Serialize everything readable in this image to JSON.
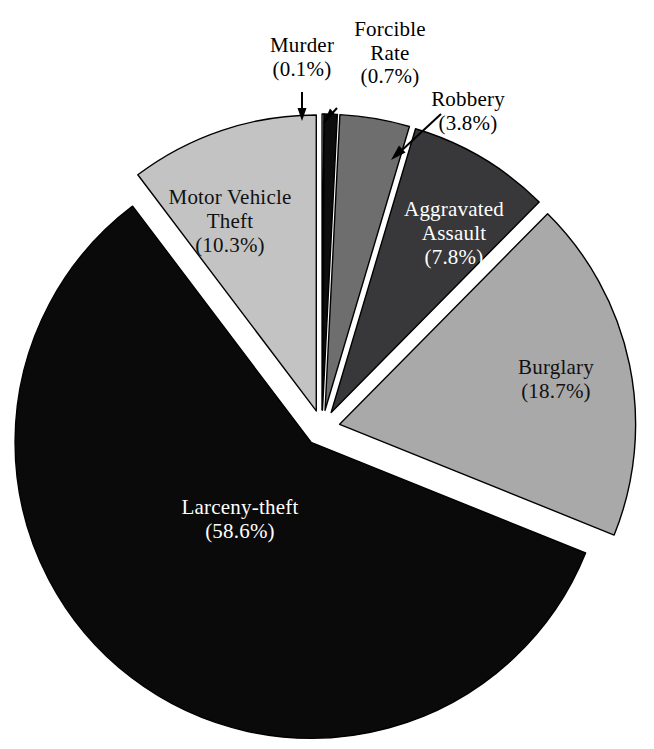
{
  "chart_data": {
    "type": "pie",
    "title": "",
    "subtitle": "",
    "xlabel": "",
    "ylabel": "",
    "legend_position": "none",
    "grid": false,
    "exploded": true,
    "units": "percent",
    "categories": [
      "Murder",
      "Forcible Rate",
      "Robbery",
      "Aggravated Assault",
      "Burglary",
      "Larceny-theft",
      "Motor Vehicle Theft"
    ],
    "values": [
      0.1,
      0.7,
      3.8,
      7.8,
      18.7,
      58.6,
      10.3
    ],
    "slices": [
      {
        "name": "Murder",
        "label": "Murder",
        "percent": 0.1,
        "percent_text": "(0.1%)",
        "color": "#ffffff",
        "stroke": "#000000",
        "label_placement": "callout",
        "label_text_color": "#000000"
      },
      {
        "name": "Forcible Rate",
        "label": "Forcible Rate",
        "label_line1": "Forcible",
        "label_line2": "Rate",
        "percent": 0.7,
        "percent_text": "(0.7%)",
        "color": "#0d0d0d",
        "stroke": "#000000",
        "label_placement": "callout",
        "label_text_color": "#000000"
      },
      {
        "name": "Robbery",
        "label": "Robbery",
        "percent": 3.8,
        "percent_text": "(3.8%)",
        "color": "#6e6e6e",
        "stroke": "#000000",
        "label_placement": "callout",
        "label_text_color": "#000000"
      },
      {
        "name": "Aggravated Assault",
        "label": "Aggravated Assault",
        "label_line1": "Aggravated",
        "label_line2": "Assault",
        "percent": 7.8,
        "percent_text": "(7.8%)",
        "color": "#38383a",
        "stroke": "#000000",
        "label_placement": "inside",
        "label_text_color": "#ffffff"
      },
      {
        "name": "Burglary",
        "label": "Burglary",
        "percent": 18.7,
        "percent_text": "(18.7%)",
        "color": "#a9a9a9",
        "stroke": "#000000",
        "label_placement": "inside",
        "label_text_color": "#111111"
      },
      {
        "name": "Larceny-theft",
        "label": "Larceny-theft",
        "percent": 58.6,
        "percent_text": "(58.6%)",
        "color": "#0a0a0a",
        "stroke": "#000000",
        "label_placement": "inside",
        "label_text_color": "#ffffff"
      },
      {
        "name": "Motor Vehicle Theft",
        "label": "Motor Vehicle Theft",
        "label_line1": "Motor Vehicle",
        "label_line2": "Theft",
        "percent": 10.3,
        "percent_text": "(10.3%)",
        "color": "#c3c3c3",
        "stroke": "#000000",
        "label_placement": "inside",
        "label_text_color": "#111111"
      }
    ]
  },
  "callouts": {
    "murder": {
      "line1": "Murder",
      "line2": "(0.1%)"
    },
    "forcible": {
      "line1": "Forcible",
      "line2": "Rate",
      "line3": "(0.7%)"
    },
    "robbery": {
      "line1": "Robbery",
      "line2": "(3.8%)"
    }
  },
  "inside_labels": {
    "motor_vehicle_theft": {
      "line1": "Motor Vehicle",
      "line2": "Theft",
      "line3": "(10.3%)"
    },
    "aggravated_assault": {
      "line1": "Aggravated",
      "line2": "Assault",
      "line3": "(7.8%)"
    },
    "burglary": {
      "line1": "Burglary",
      "line2": "(18.7%)"
    },
    "larceny_theft": {
      "line1": "Larceny-theft",
      "line2": "(58.6%)"
    }
  },
  "colors": {
    "background": "#ffffff",
    "outline": "#000000",
    "murder": "#ffffff",
    "forcible_rate": "#0d0d0d",
    "robbery": "#6e6e6e",
    "aggravated_assault": "#38383a",
    "burglary": "#a9a9a9",
    "larceny_theft": "#0a0a0a",
    "motor_vehicle_theft": "#c3c3c3"
  }
}
